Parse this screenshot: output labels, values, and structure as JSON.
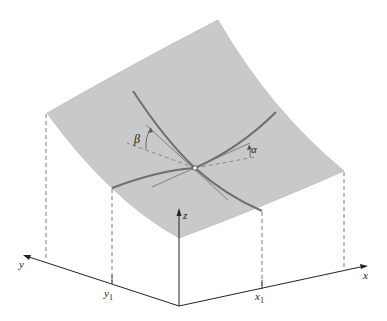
{
  "diagram": {
    "type": "3d-surface-with-partial-derivative-slopes",
    "labels": {
      "x_axis": "x",
      "y_axis": "y",
      "z_axis": "z",
      "x1": "x",
      "x1_sub": "1",
      "y1": "y",
      "y1_sub": "1",
      "alpha": "α",
      "beta": "β"
    },
    "colors": {
      "surface_fill": "#c9c9c9",
      "surface_edge": "#b5b5b5",
      "trace_curves": "#6e6e6e",
      "axes": "#222222",
      "dashed": "#555555"
    }
  }
}
